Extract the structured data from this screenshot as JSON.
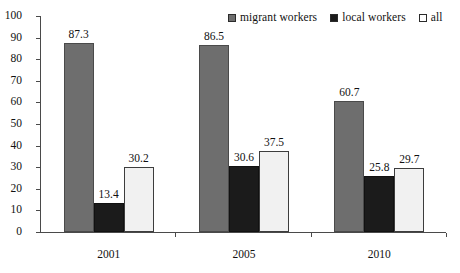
{
  "chart_data": {
    "type": "bar",
    "title": "",
    "xlabel": "",
    "ylabel": "",
    "ylim": [
      0,
      100
    ],
    "yticks": [
      0,
      10,
      20,
      30,
      40,
      50,
      60,
      70,
      80,
      90,
      100
    ],
    "grid": false,
    "legend_position": "top-right",
    "categories": [
      "2001",
      "2005",
      "2010"
    ],
    "series": [
      {
        "name": "migrant workers",
        "color": "#6e6e6e",
        "values": [
          87.3,
          86.5,
          60.7
        ],
        "labels": [
          "87.3",
          "86.5",
          "60.7"
        ]
      },
      {
        "name": "local workers",
        "color": "#1b1b1b",
        "values": [
          13.4,
          30.6,
          25.8
        ],
        "labels": [
          "13.4",
          "30.6",
          "25.8"
        ]
      },
      {
        "name": "all",
        "color": "#f1f1f1",
        "values": [
          30.2,
          37.5,
          29.7
        ],
        "labels": [
          "30.2",
          "37.5",
          "29.7"
        ]
      }
    ]
  },
  "axis": {
    "tick_labels": [
      "100",
      "90",
      "80",
      "70",
      "60",
      "50",
      "40",
      "30",
      "20",
      "10",
      "0"
    ]
  },
  "legend": {
    "entries": [
      {
        "label": "migrant workers",
        "color": "#6e6e6e"
      },
      {
        "label": "local workers",
        "color": "#1b1b1b"
      },
      {
        "label": "all",
        "color": "#ffffff"
      }
    ]
  }
}
